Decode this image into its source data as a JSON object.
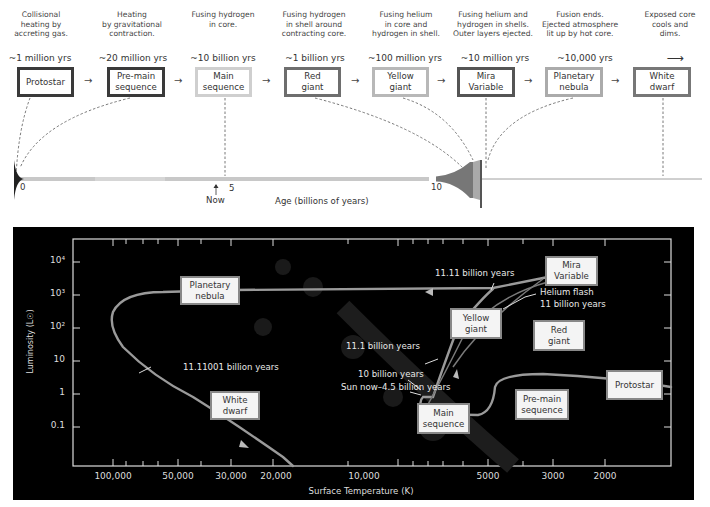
{
  "timeline": {
    "stages": [
      {
        "name": "Protostar",
        "line1": "Protostar",
        "line2": "",
        "desc": [
          "Collisional",
          "heating by",
          "accreting gas."
        ],
        "duration": "~1 million yrs",
        "border": "#3a3a3a"
      },
      {
        "name": "Pre-main sequence",
        "line1": "Pre-main",
        "line2": "sequence",
        "desc": [
          "Heating",
          "by gravitational",
          "contraction."
        ],
        "duration": "~20 million yrs",
        "border": "#3a3a3a"
      },
      {
        "name": "Main sequence",
        "line1": "Main",
        "line2": "sequence",
        "desc": [
          "Fusing hydrogen",
          "in core.",
          ""
        ],
        "duration": "~10 billion yrs",
        "border": "#c8c8c8"
      },
      {
        "name": "Red giant",
        "line1": "Red",
        "line2": "giant",
        "desc": [
          "Fusing hydrogen",
          "in shell around",
          "contracting core."
        ],
        "duration": "~1 billion yrs",
        "border": "#6e6e6e"
      },
      {
        "name": "Yellow giant",
        "line1": "Yellow",
        "line2": "giant",
        "desc": [
          "Fusing helium",
          "in core and",
          "hydrogen in shell."
        ],
        "duration": "~100 million yrs",
        "border": "#b4b4b4"
      },
      {
        "name": "Mira Variable",
        "line1": "Mira",
        "line2": "Variable",
        "desc": [
          "Fusing helium and",
          "hydrogen in shells.",
          "Outer layers ejected."
        ],
        "duration": "~10 million yrs",
        "border": "#555555"
      },
      {
        "name": "Planetary nebula",
        "line1": "Planetary",
        "line2": "nebula",
        "desc": [
          "Fusion ends.",
          "Ejected atmosphere",
          "lit up by hot core."
        ],
        "duration": "~10,000 yrs",
        "border": "#aaaaaa"
      },
      {
        "name": "White dwarf",
        "line1": "White",
        "line2": "dwarf",
        "desc": [
          "Exposed core",
          "cools and",
          "dims."
        ],
        "duration": "⟶",
        "border": "#777777"
      }
    ],
    "arrow": "→",
    "age_axis": {
      "ticks": [
        "0",
        "5",
        "10"
      ],
      "now_label": "Now",
      "now_arrow": "↑",
      "label": "Age (billions of years)"
    }
  },
  "hr_diagram": {
    "y_axis_label": "Luminosity (L☉)",
    "x_axis_label": "Surface Temperature (K)",
    "y_ticks": [
      "10⁴",
      "10³",
      "10²",
      "10",
      "1",
      "0.1"
    ],
    "x_ticks": [
      "100,000",
      "50,000",
      "30,000",
      "20,000",
      "10,000",
      "5000",
      "3000",
      "2000"
    ],
    "boxes": {
      "planetary_nebula": [
        "Planetary",
        "nebula"
      ],
      "white_dwarf": [
        "White",
        "dwarf"
      ],
      "yellow_giant": [
        "Yellow",
        "giant"
      ],
      "mira_variable": [
        "Mira",
        "Variable"
      ],
      "red_giant": [
        "Red",
        "giant"
      ],
      "main_sequence": [
        "Main",
        "sequence"
      ],
      "pre_main_sequence": [
        "Pre-main",
        "sequence"
      ],
      "protostar": [
        "Protostar"
      ]
    },
    "annotations": {
      "t_11_11": "11.11 billion years",
      "t_11_11001": "11.11001 billion years",
      "helium_flash_1": "Helium flash",
      "helium_flash_2": "11 billion years",
      "t_11_1": "11.1 billion years",
      "t_10": "10 billion years",
      "sun_now": "Sun now–4.5 billion years"
    }
  }
}
